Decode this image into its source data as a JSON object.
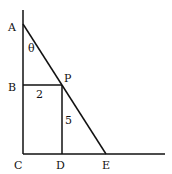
{
  "diagram": {
    "points": {
      "A": {
        "label": "A"
      },
      "B": {
        "label": "B"
      },
      "C": {
        "label": "C"
      },
      "D": {
        "label": "D"
      },
      "E": {
        "label": "E"
      },
      "P": {
        "label": "P"
      }
    },
    "angle_label": "θ",
    "segment_labels": {
      "BP": "2",
      "PD": "5"
    },
    "line_color": "#111111"
  }
}
